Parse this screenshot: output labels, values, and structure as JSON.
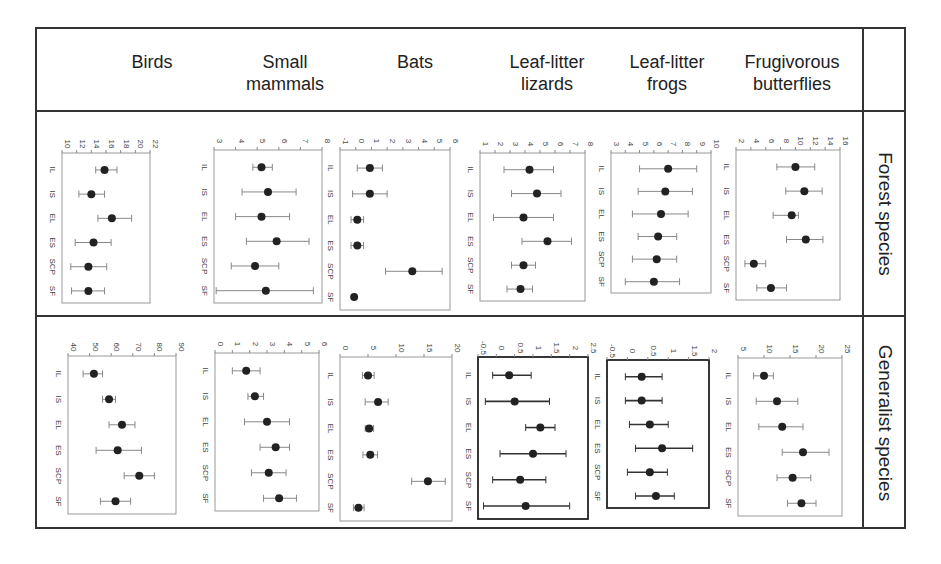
{
  "columns": [
    {
      "label_line1": "Birds",
      "label_line2": ""
    },
    {
      "label_line1": "Small",
      "label_line2": "mammals"
    },
    {
      "label_line1": "Bats",
      "label_line2": ""
    },
    {
      "label_line1": "Leaf-litter",
      "label_line2": "lizards"
    },
    {
      "label_line1": "Leaf-litter",
      "label_line2": "frogs"
    },
    {
      "label_line1": "Frugivorous",
      "label_line2": "butterflies"
    }
  ],
  "rows": [
    {
      "label": "Forest species"
    },
    {
      "label": "Generalist species"
    }
  ],
  "categories": [
    "IL",
    "IS",
    "EL",
    "ES",
    "SCP",
    "SF"
  ],
  "chart_data": [
    {
      "type": "scatter",
      "panel": "Birds / Forest species",
      "categories": [
        "IL",
        "IS",
        "EL",
        "ES",
        "SCP",
        "SF"
      ],
      "ticks": [
        10,
        12,
        14,
        16,
        18,
        20,
        22
      ],
      "xlim": [
        10,
        22
      ],
      "values": [
        15.8,
        14.0,
        16.8,
        14.3,
        13.6,
        13.6
      ],
      "lower": [
        14.6,
        12.3,
        14.9,
        11.8,
        11.2,
        11.3
      ],
      "upper": [
        17.5,
        15.8,
        19.5,
        16.7,
        16.1,
        15.8
      ]
    },
    {
      "type": "scatter",
      "panel": "Small mammals / Forest species",
      "categories": [
        "IL",
        "IS",
        "EL",
        "ES",
        "SCP",
        "SF"
      ],
      "ticks": [
        3,
        4,
        5,
        6,
        7,
        8
      ],
      "xlim": [
        3,
        8
      ],
      "values": [
        5.2,
        5.5,
        5.2,
        5.9,
        4.9,
        5.4
      ],
      "lower": [
        4.8,
        4.3,
        4.0,
        4.5,
        3.8,
        3.1
      ],
      "upper": [
        5.7,
        6.8,
        6.5,
        7.4,
        6.0,
        7.6
      ]
    },
    {
      "type": "scatter",
      "panel": "Bats / Forest species",
      "categories": [
        "IL",
        "IS",
        "EL",
        "ES",
        "SCP",
        "SF"
      ],
      "ticks": [
        -1,
        0,
        1,
        2,
        3,
        4,
        5,
        6
      ],
      "xlim": [
        -1,
        6
      ],
      "values": [
        0.9,
        0.9,
        0.1,
        0.1,
        3.6,
        -0.1
      ],
      "lower": [
        0.1,
        -0.2,
        -0.3,
        -0.3,
        1.9,
        -0.1
      ],
      "upper": [
        1.7,
        2.0,
        0.5,
        0.5,
        5.5,
        -0.1
      ]
    },
    {
      "type": "scatter",
      "panel": "Leaf-litter lizards / Forest species",
      "categories": [
        "IL",
        "IS",
        "EL",
        "ES",
        "SCP",
        "SF"
      ],
      "ticks": [
        1,
        2,
        3,
        4,
        5,
        6,
        7,
        8
      ],
      "xlim": [
        1,
        8
      ],
      "values": [
        4.3,
        4.8,
        3.9,
        5.5,
        3.9,
        3.7
      ],
      "lower": [
        2.6,
        3.1,
        1.9,
        3.8,
        3.1,
        2.8
      ],
      "upper": [
        5.9,
        6.4,
        5.9,
        7.1,
        4.7,
        4.5
      ]
    },
    {
      "type": "scatter",
      "panel": "Leaf-litter frogs / Forest species",
      "categories": [
        "IL",
        "IS",
        "EL",
        "ES",
        "SCP",
        "SF"
      ],
      "ticks": [
        3,
        4,
        5,
        6,
        7,
        8,
        9,
        10
      ],
      "xlim": [
        3,
        10
      ],
      "values": [
        7.0,
        6.8,
        6.5,
        6.3,
        6.2,
        6.0
      ],
      "lower": [
        5.0,
        4.9,
        4.5,
        4.9,
        4.5,
        4.0
      ],
      "upper": [
        9.0,
        8.7,
        8.4,
        7.6,
        7.6,
        7.8
      ]
    },
    {
      "type": "scatter",
      "panel": "Frugivorous butterflies / Forest species",
      "categories": [
        "IL",
        "IS",
        "EL",
        "ES",
        "SCP",
        "SF"
      ],
      "ticks": [
        2,
        4,
        6,
        8,
        10,
        12,
        14,
        16
      ],
      "xlim": [
        2,
        16
      ],
      "values": [
        10.0,
        11.2,
        9.5,
        11.4,
        4.4,
        6.7
      ],
      "lower": [
        7.5,
        8.7,
        7.0,
        8.8,
        3.2,
        4.8
      ],
      "upper": [
        12.6,
        13.6,
        10.4,
        13.7,
        6.0,
        8.8
      ]
    },
    {
      "type": "scatter",
      "panel": "Birds / Generalist species",
      "categories": [
        "IL",
        "IS",
        "EL",
        "ES",
        "SCP",
        "SF"
      ],
      "ticks": [
        40,
        50,
        60,
        70,
        80,
        90
      ],
      "xlim": [
        40,
        90
      ],
      "values": [
        52,
        59,
        65,
        63,
        73,
        62
      ],
      "lower": [
        47,
        56,
        59,
        53,
        66,
        55
      ],
      "upper": [
        56,
        62,
        71,
        74,
        80,
        69
      ]
    },
    {
      "type": "scatter",
      "panel": "Small mammals / Generalist species",
      "categories": [
        "IL",
        "IS",
        "EL",
        "ES",
        "SCP",
        "SF"
      ],
      "ticks": [
        0,
        1,
        2,
        3,
        4,
        5,
        6
      ],
      "xlim": [
        0,
        6
      ],
      "values": [
        1.8,
        2.3,
        3.0,
        3.5,
        3.1,
        3.7
      ],
      "lower": [
        1.0,
        1.9,
        1.7,
        2.6,
        2.1,
        2.8
      ],
      "upper": [
        2.6,
        2.8,
        4.3,
        4.3,
        4.1,
        4.7
      ]
    },
    {
      "type": "scatter",
      "panel": "Bats / Generalist species",
      "categories": [
        "IL",
        "IS",
        "EL",
        "ES",
        "SCP",
        "SF"
      ],
      "ticks": [
        0,
        5,
        10,
        15,
        20
      ],
      "xlim": [
        0,
        20
      ],
      "values": [
        5.0,
        6.8,
        5.2,
        5.4,
        15.7,
        3.3
      ],
      "lower": [
        4.0,
        4.5,
        4.5,
        4.1,
        12.8,
        2.4
      ],
      "upper": [
        6.1,
        8.6,
        6.0,
        6.7,
        18.8,
        4.3
      ]
    },
    {
      "type": "scatter",
      "panel": "Leaf-litter lizards / Generalist species",
      "categories": [
        "IL",
        "IS",
        "EL",
        "ES",
        "SCP",
        "SF"
      ],
      "ticks": [
        -0.5,
        0.0,
        0.5,
        1.0,
        1.5,
        2.0,
        2.5
      ],
      "xlim": [
        -0.5,
        2.5
      ],
      "values": [
        0.35,
        0.5,
        1.2,
        1.0,
        0.65,
        0.8
      ],
      "lower": [
        -0.1,
        -0.3,
        0.8,
        0.1,
        -0.1,
        -0.35
      ],
      "upper": [
        0.95,
        1.45,
        1.6,
        1.9,
        1.35,
        2.0
      ]
    },
    {
      "type": "scatter",
      "panel": "Leaf-litter frogs / Generalist species",
      "categories": [
        "IL",
        "IS",
        "EL",
        "ES",
        "SCP",
        "SF"
      ],
      "ticks": [
        -0.5,
        0.0,
        0.5,
        1.0,
        1.5,
        2.0
      ],
      "xlim": [
        -0.5,
        2.0
      ],
      "values": [
        0.35,
        0.35,
        0.55,
        0.85,
        0.55,
        0.7
      ],
      "lower": [
        -0.05,
        -0.05,
        0.05,
        0.2,
        0.0,
        0.2
      ],
      "upper": [
        0.85,
        0.85,
        1.0,
        1.6,
        0.98,
        1.15
      ]
    },
    {
      "type": "scatter",
      "panel": "Frugivorous butterflies / Generalist species",
      "categories": [
        "IL",
        "IS",
        "EL",
        "ES",
        "SCP",
        "SF"
      ],
      "ticks": [
        5,
        10,
        15,
        20,
        25
      ],
      "xlim": [
        5,
        25
      ],
      "values": [
        10.0,
        12.5,
        13.5,
        17.5,
        15.5,
        17.2
      ],
      "lower": [
        8.0,
        8.5,
        9.0,
        13.5,
        12.5,
        14.5
      ],
      "upper": [
        11.8,
        16.5,
        17.5,
        22.5,
        19.0,
        20.0
      ]
    }
  ]
}
